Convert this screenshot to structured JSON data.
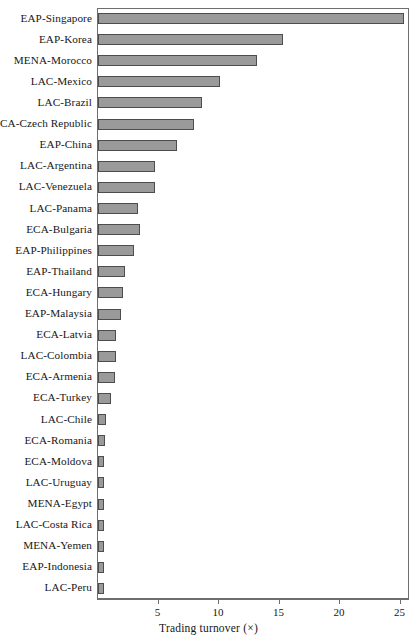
{
  "chart_data": {
    "type": "bar",
    "orientation": "horizontal",
    "title": "",
    "xlabel": "Trading turnover (×)",
    "ylabel": "",
    "xlim": [
      0,
      25.7
    ],
    "xticks": [
      5,
      10,
      15,
      20,
      25
    ],
    "grid": false,
    "legend": null,
    "categories": [
      "EAP-Singapore",
      "EAP-Korea",
      "MENA-Morocco",
      "LAC-Mexico",
      "LAC-Brazil",
      "ECA-Czech Republic",
      "EAP-China",
      "LAC-Argentina",
      "LAC-Venezuela",
      "LAC-Panama",
      "ECA-Bulgaria",
      "EAP-Philippines",
      "EAP-Thailand",
      "ECA-Hungary",
      "EAP-Malaysia",
      "ECA-Latvia",
      "LAC-Colombia",
      "ECA-Armenia",
      "ECA-Turkey",
      "LAC-Chile",
      "ECA-Romania",
      "ECA-Moldova",
      "LAC-Uruguay",
      "MENA-Egypt",
      "LAC-Costa Rica",
      "MENA-Yemen",
      "EAP-Indonesia",
      "LAC-Peru"
    ],
    "values": [
      25.3,
      15.3,
      13.1,
      10.1,
      8.6,
      7.9,
      6.5,
      4.7,
      4.7,
      3.3,
      3.5,
      3.0,
      2.2,
      2.1,
      1.9,
      1.5,
      1.5,
      1.4,
      1.1,
      0.65,
      0.6,
      0.5,
      0.5,
      0.5,
      0.5,
      0.5,
      0.5,
      0.5
    ],
    "bar_color": "#9a9a9a",
    "bar_edge_color": "#4d4d4d"
  },
  "axis": {
    "tick_labels": [
      "5",
      "10",
      "15",
      "20",
      "25"
    ],
    "title": "Trading turnover (×)"
  }
}
